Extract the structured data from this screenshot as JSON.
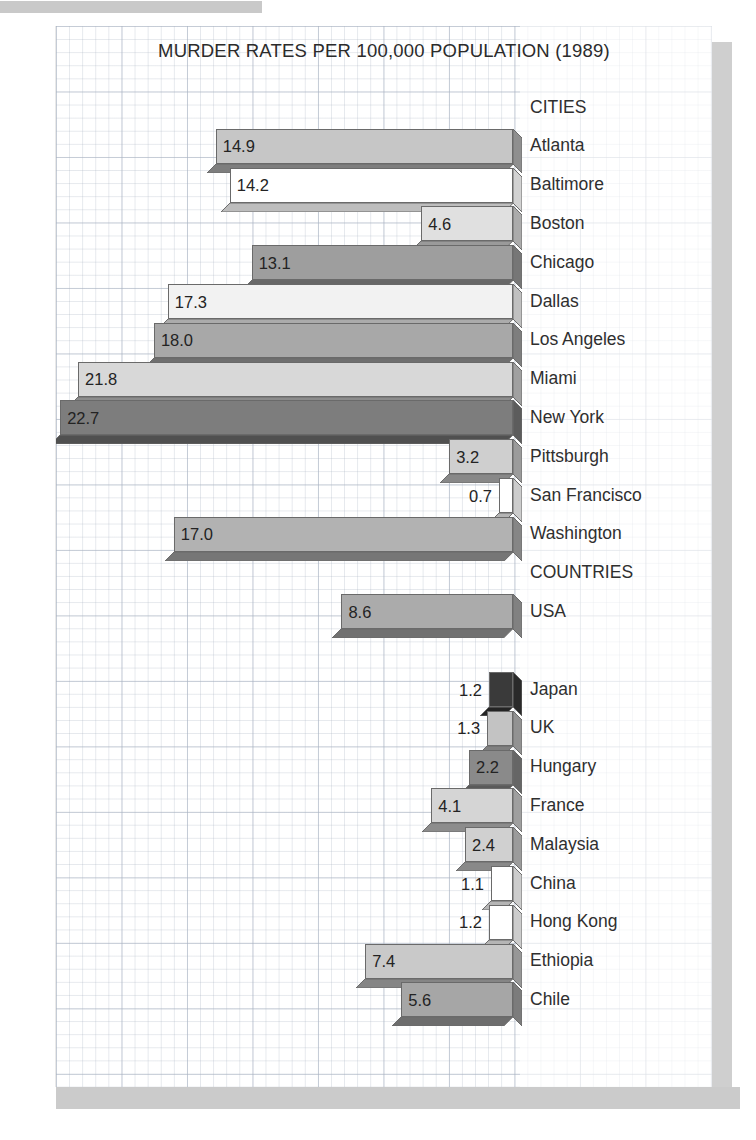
{
  "chart_data": {
    "type": "bar",
    "orientation": "horizontal",
    "title": "MURDER RATES PER 100,000 POPULATION (1989)",
    "xlabel": "",
    "ylabel": "",
    "grid": true,
    "legend": "none",
    "xlim": [
      0,
      23.5
    ],
    "style": "3d-grayscale-bars-on-graph-paper",
    "group_headers": [
      "CITIES",
      "COUNTRIES"
    ],
    "categories": [
      "Atlanta",
      "Baltimore",
      "Boston",
      "Chicago",
      "Dallas",
      "Los Angeles",
      "Miami",
      "New York",
      "Pittsburgh",
      "San Francisco",
      "Washington",
      "USA",
      "Japan",
      "UK",
      "Hungary",
      "France",
      "Malaysia",
      "China",
      "Hong Kong",
      "Ethiopia",
      "Chile"
    ],
    "values": [
      14.9,
      14.2,
      4.6,
      13.1,
      17.3,
      18.0,
      21.8,
      22.7,
      3.2,
      0.7,
      17.0,
      8.6,
      1.2,
      1.3,
      2.2,
      4.1,
      2.4,
      1.1,
      1.2,
      7.4,
      5.6
    ],
    "rows": [
      {
        "kind": "header",
        "label": "CITIES"
      },
      {
        "kind": "bar",
        "label": "Atlanta",
        "value": 14.9,
        "value_text": "14.9",
        "fill": "#c6c6c6",
        "side": "#8f8f8f",
        "bevel": "#7e7e7e",
        "label_outside": false
      },
      {
        "kind": "bar",
        "label": "Baltimore",
        "value": 14.2,
        "value_text": "14.2",
        "fill": "#ffffff",
        "side": "#d2d2d2",
        "bevel": "#bdbdbd",
        "label_outside": false
      },
      {
        "kind": "bar",
        "label": "Boston",
        "value": 4.6,
        "value_text": "4.6",
        "fill": "#e0e0e0",
        "side": "#ababab",
        "bevel": "#9a9a9a",
        "label_outside": false
      },
      {
        "kind": "bar",
        "label": "Chicago",
        "value": 13.1,
        "value_text": "13.1",
        "fill": "#9e9e9e",
        "side": "#767676",
        "bevel": "#686868",
        "label_outside": false
      },
      {
        "kind": "bar",
        "label": "Dallas",
        "value": 17.3,
        "value_text": "17.3",
        "fill": "#f2f2f2",
        "side": "#c0c0c0",
        "bevel": "#ababab",
        "label_outside": false
      },
      {
        "kind": "bar",
        "label": "Los Angeles",
        "value": 18.0,
        "value_text": "18.0",
        "fill": "#a8a8a8",
        "side": "#7e7e7e",
        "bevel": "#6f6f6f",
        "label_outside": false
      },
      {
        "kind": "bar",
        "label": "Miami",
        "value": 21.8,
        "value_text": "21.8",
        "fill": "#d8d8d8",
        "side": "#a0a0a0",
        "bevel": "#8d8d8d",
        "label_outside": false
      },
      {
        "kind": "bar",
        "label": "New York",
        "value": 22.7,
        "value_text": "22.7",
        "fill": "#7d7d7d",
        "side": "#5c5c5c",
        "bevel": "#505050",
        "label_outside": false
      },
      {
        "kind": "bar",
        "label": "Pittsburgh",
        "value": 3.2,
        "value_text": "3.2",
        "fill": "#cfcfcf",
        "side": "#9b9b9b",
        "bevel": "#888888",
        "label_outside": false
      },
      {
        "kind": "bar",
        "label": "San Francisco",
        "value": 0.7,
        "value_text": "0.7",
        "fill": "#ffffff",
        "side": "#cccccc",
        "bevel": "#b5b5b5",
        "label_outside": true
      },
      {
        "kind": "bar",
        "label": "Washington",
        "value": 17.0,
        "value_text": "17.0",
        "fill": "#b2b2b2",
        "side": "#868686",
        "bevel": "#767676",
        "label_outside": false
      },
      {
        "kind": "header",
        "label": "COUNTRIES"
      },
      {
        "kind": "bar",
        "label": "USA",
        "value": 8.6,
        "value_text": "8.6",
        "fill": "#ababab",
        "side": "#818181",
        "bevel": "#717171",
        "label_outside": false
      },
      {
        "kind": "gap"
      },
      {
        "kind": "bar",
        "label": "Japan",
        "value": 1.2,
        "value_text": "1.2",
        "fill": "#3a3a3a",
        "side": "#2a2a2a",
        "bevel": "#242424",
        "label_outside": true
      },
      {
        "kind": "bar",
        "label": "UK",
        "value": 1.3,
        "value_text": "1.3",
        "fill": "#c3c3c3",
        "side": "#929292",
        "bevel": "#808080",
        "label_outside": true
      },
      {
        "kind": "bar",
        "label": "Hungary",
        "value": 2.2,
        "value_text": "2.2",
        "fill": "#8a8a8a",
        "side": "#666666",
        "bevel": "#5a5a5a",
        "label_outside": false
      },
      {
        "kind": "bar",
        "label": "France",
        "value": 4.1,
        "value_text": "4.1",
        "fill": "#d5d5d5",
        "side": "#9f9f9f",
        "bevel": "#8c8c8c",
        "label_outside": false
      },
      {
        "kind": "bar",
        "label": "Malaysia",
        "value": 2.4,
        "value_text": "2.4",
        "fill": "#d0d0d0",
        "side": "#9b9b9b",
        "bevel": "#898989",
        "label_outside": false
      },
      {
        "kind": "bar",
        "label": "China",
        "value": 1.1,
        "value_text": "1.1",
        "fill": "#ffffff",
        "side": "#cccccc",
        "bevel": "#b5b5b5",
        "label_outside": true
      },
      {
        "kind": "bar",
        "label": "Hong Kong",
        "value": 1.2,
        "value_text": "1.2",
        "fill": "#ffffff",
        "side": "#cccccc",
        "bevel": "#b5b5b5",
        "label_outside": true
      },
      {
        "kind": "bar",
        "label": "Ethiopia",
        "value": 7.4,
        "value_text": "7.4",
        "fill": "#c9c9c9",
        "side": "#979797",
        "bevel": "#858585",
        "label_outside": false
      },
      {
        "kind": "bar",
        "label": "Chile",
        "value": 5.6,
        "value_text": "5.6",
        "fill": "#a6a6a6",
        "side": "#7c7c7c",
        "bevel": "#6d6d6d",
        "label_outside": false
      }
    ]
  }
}
